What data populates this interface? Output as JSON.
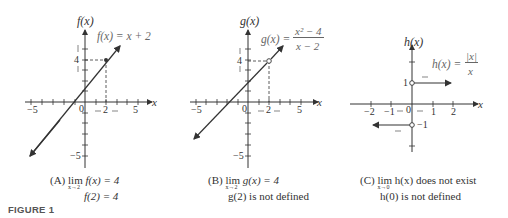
{
  "figure_label": "FIGURE 1",
  "panels": [
    {
      "id": "A",
      "y_axis_label": "f(x)",
      "x_axis_label": "x",
      "formula": "f(x) = x + 2",
      "tick_labels": {
        "x_neg": "−5",
        "x_pos": "5",
        "x_two": "2",
        "origin": "0",
        "y_four": "4",
        "y_neg": "−5"
      },
      "caption_line1_prefix": "(A)",
      "caption_line1_lim": "lim",
      "caption_line1_sub": "x→2",
      "caption_line1_rest": "f(x) = 4",
      "caption_line2": "f(2) = 4"
    },
    {
      "id": "B",
      "y_axis_label": "g(x)",
      "x_axis_label": "x",
      "formula_lhs": "g(x) =",
      "formula_num": "x² − 4",
      "formula_den": "x − 2",
      "tick_labels": {
        "x_neg": "−5",
        "x_pos": "5",
        "x_two": "2",
        "origin": "0",
        "y_four": "4",
        "y_neg": "−5"
      },
      "caption_line1_prefix": "(B)",
      "caption_line1_lim": "lim",
      "caption_line1_sub": "x→2",
      "caption_line1_rest": "g(x) = 4",
      "caption_line2": "g(2) is not defined"
    },
    {
      "id": "C",
      "y_axis_label": "h(x)",
      "x_axis_label": "x",
      "formula_lhs": "h(x) =",
      "formula_num": "|x|",
      "formula_den": "x",
      "tick_labels": {
        "x_m2": "−2",
        "x_m1": "−1",
        "origin": "0",
        "x_1": "1",
        "x_2": "2",
        "y_1": "1",
        "y_m1": "−1"
      },
      "caption_line1_prefix": "(C)",
      "caption_line1_lim": "lim",
      "caption_line1_sub": "x→0",
      "caption_line1_rest": "h(x) does not exist",
      "caption_line2": "h(0) is not defined"
    }
  ]
}
